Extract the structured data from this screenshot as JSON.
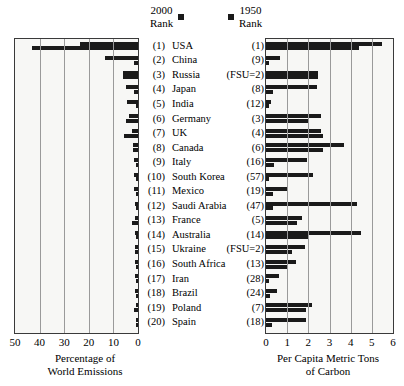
{
  "legend": {
    "left_label_line1": "2000",
    "left_label_line2": "Rank",
    "right_label_line1": "1950",
    "right_label_line2": "Rank",
    "marker_color": "#1a1a1a"
  },
  "left_axis": {
    "ticks": [
      "50",
      "40",
      "30",
      "20",
      "10",
      "0"
    ],
    "caption_line1": "Percentage of",
    "caption_line2": "World Emissions"
  },
  "right_axis": {
    "ticks": [
      "0",
      "1",
      "2",
      "3",
      "4",
      "5",
      "6"
    ],
    "caption_line1": "Per Capita Metric Tons",
    "caption_line2": "of Carbon"
  },
  "rows": [
    {
      "rank2000": "(1)",
      "name": "USA",
      "rank1950": "(1)",
      "emissions_2000": 23.5,
      "emissions_1950": 43.0,
      "percap_2000": 5.5,
      "percap_1950": 4.4
    },
    {
      "rank2000": "(2)",
      "name": "China",
      "rank1950": "(9)",
      "emissions_2000": 13.5,
      "emissions_1950": 1.5,
      "percap_2000": 0.65,
      "percap_1950": 0.05
    },
    {
      "rank2000": "(3)",
      "name": "Russia",
      "rank1950": "(FSU=2)",
      "emissions_2000": 6.2,
      "emissions_1950": 6.2,
      "percap_2000": 2.45,
      "percap_1950": 2.45
    },
    {
      "rank2000": "(4)",
      "name": "Japan",
      "rank1950": "(8)",
      "emissions_2000": 5.0,
      "emissions_1950": 1.7,
      "percap_2000": 2.4,
      "percap_1950": 0.35
    },
    {
      "rank2000": "(5)",
      "name": "India",
      "rank1950": "(12)",
      "emissions_2000": 4.4,
      "emissions_1950": 1.0,
      "percap_2000": 0.25,
      "percap_1950": 0.04
    },
    {
      "rank2000": "(6)",
      "name": "Germany",
      "rank1950": "(3)",
      "emissions_2000": 3.6,
      "emissions_1950": 5.0,
      "percap_2000": 2.6,
      "percap_1950": 2.05
    },
    {
      "rank2000": "(7)",
      "name": "UK",
      "rank1950": "(4)",
      "emissions_2000": 2.3,
      "emissions_1950": 5.5,
      "percap_2000": 2.6,
      "percap_1950": 2.7
    },
    {
      "rank2000": "(8)",
      "name": "Canada",
      "rank1950": "(6)",
      "emissions_2000": 1.9,
      "emissions_1950": 1.9,
      "percap_2000": 3.7,
      "percap_1950": 2.7
    },
    {
      "rank2000": "(9)",
      "name": "Italy",
      "rank1950": "(16)",
      "emissions_2000": 1.8,
      "emissions_1950": 0.7,
      "percap_2000": 1.95,
      "percap_1950": 0.4
    },
    {
      "rank2000": "(10)",
      "name": "South Korea",
      "rank1950": "(57)",
      "emissions_2000": 1.8,
      "emissions_1950": 0.1,
      "percap_2000": 2.2,
      "percap_1950": 0.05
    },
    {
      "rank2000": "(11)",
      "name": "Mexico",
      "rank1950": "(19)",
      "emissions_2000": 1.5,
      "emissions_1950": 0.5,
      "percap_2000": 1.05,
      "percap_1950": 0.35
    },
    {
      "rank2000": "(12)",
      "name": "Saudi Arabia",
      "rank1950": "(47)",
      "emissions_2000": 1.4,
      "emissions_1950": 0.15,
      "percap_2000": 4.3,
      "percap_1950": 0.35
    },
    {
      "rank2000": "(13)",
      "name": "France",
      "rank1950": "(5)",
      "emissions_2000": 1.4,
      "emissions_1950": 2.6,
      "percap_2000": 1.7,
      "percap_1950": 1.45
    },
    {
      "rank2000": "(14)",
      "name": "Australia",
      "rank1950": "(14)",
      "emissions_2000": 1.3,
      "emissions_1950": 0.8,
      "percap_2000": 4.5,
      "percap_1950": 2.0
    },
    {
      "rank2000": "(15)",
      "name": "Ukraine",
      "rank1950": "(FSU=2)",
      "emissions_2000": 1.2,
      "emissions_1950": 1.2,
      "percap_2000": 1.85,
      "percap_1950": 1.25
    },
    {
      "rank2000": "(16)",
      "name": "South Africa",
      "rank1950": "(13)",
      "emissions_2000": 1.2,
      "emissions_1950": 0.8,
      "percap_2000": 1.4,
      "percap_1950": 1.0
    },
    {
      "rank2000": "(17)",
      "name": "Iran",
      "rank1950": "(28)",
      "emissions_2000": 1.2,
      "emissions_1950": 0.2,
      "percap_2000": 0.6,
      "percap_1950": 0.15
    },
    {
      "rank2000": "(18)",
      "name": "Brazil",
      "rank1950": "(24)",
      "emissions_2000": 1.1,
      "emissions_1950": 0.3,
      "percap_2000": 0.5,
      "percap_1950": 0.2
    },
    {
      "rank2000": "(19)",
      "name": "Poland",
      "rank1950": "(7)",
      "emissions_2000": 1.0,
      "emissions_1950": 1.6,
      "percap_2000": 2.15,
      "percap_1950": 1.9
    },
    {
      "rank2000": "(20)",
      "name": "Spain",
      "rank1950": "(18)",
      "emissions_2000": 1.0,
      "emissions_1950": 0.3,
      "percap_2000": 1.9,
      "percap_1950": 0.3
    }
  ],
  "chart_data": {
    "type": "bar",
    "title": "",
    "orientation": "horizontal",
    "panels": [
      {
        "name": "Percentage of World Emissions",
        "xlabel": "Percentage of World Emissions",
        "xlim": [
          50,
          0
        ],
        "direction": "right-to-left",
        "ticks": [
          50,
          40,
          30,
          20,
          10,
          0
        ],
        "grid": true,
        "categories": [
          "USA",
          "China",
          "Russia",
          "Japan",
          "India",
          "Germany",
          "UK",
          "Canada",
          "Italy",
          "South Korea",
          "Mexico",
          "Saudi Arabia",
          "France",
          "Australia",
          "Ukraine",
          "South Africa",
          "Iran",
          "Brazil",
          "Poland",
          "Spain"
        ],
        "series": [
          {
            "name": "2000 Rank",
            "values": [
              23.5,
              13.5,
              6.2,
              5.0,
              4.4,
              3.6,
              2.3,
              1.9,
              1.8,
              1.8,
              1.5,
              1.4,
              1.4,
              1.3,
              1.2,
              1.2,
              1.2,
              1.1,
              1.0,
              1.0
            ]
          },
          {
            "name": "1950 Rank",
            "values": [
              43.0,
              1.5,
              6.2,
              1.7,
              1.0,
              5.0,
              5.5,
              1.9,
              0.7,
              0.1,
              0.5,
              0.15,
              2.6,
              0.8,
              1.2,
              0.8,
              0.2,
              0.3,
              1.6,
              0.3
            ]
          }
        ]
      },
      {
        "name": "Per Capita Metric Tons of Carbon",
        "xlabel": "Per Capita Metric Tons of Carbon",
        "xlim": [
          0,
          6
        ],
        "direction": "left-to-right",
        "ticks": [
          0,
          1,
          2,
          3,
          4,
          5,
          6
        ],
        "grid": true,
        "categories": [
          "USA",
          "China",
          "Russia",
          "Japan",
          "India",
          "Germany",
          "UK",
          "Canada",
          "Italy",
          "South Korea",
          "Mexico",
          "Saudi Arabia",
          "France",
          "Australia",
          "Ukraine",
          "South Africa",
          "Iran",
          "Brazil",
          "Poland",
          "Spain"
        ],
        "series": [
          {
            "name": "2000 Rank",
            "values": [
              5.5,
              0.65,
              2.45,
              2.4,
              0.25,
              2.6,
              2.6,
              3.7,
              1.95,
              2.2,
              1.05,
              4.3,
              1.7,
              4.5,
              1.85,
              1.4,
              0.6,
              0.5,
              2.15,
              1.9
            ]
          },
          {
            "name": "1950 Rank",
            "values": [
              4.4,
              0.05,
              2.45,
              0.35,
              0.04,
              2.05,
              2.7,
              2.7,
              0.4,
              0.05,
              0.35,
              0.35,
              1.45,
              2.0,
              1.25,
              1.0,
              0.15,
              0.2,
              1.9,
              0.3
            ]
          }
        ]
      }
    ],
    "legend": [
      "2000 Rank",
      "1950 Rank"
    ],
    "legend_position": "top-center"
  }
}
